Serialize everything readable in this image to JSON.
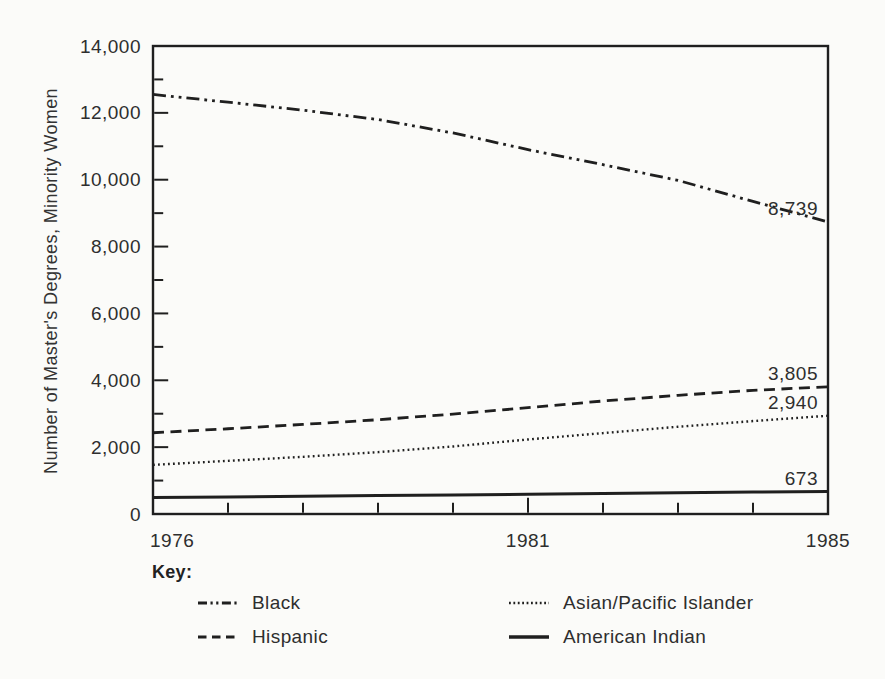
{
  "page": {
    "background": "#fbfbf9",
    "ink_color": "#1f1f1f",
    "text_color": "#2e2e2e"
  },
  "chart_data": {
    "type": "line",
    "title": "",
    "xlabel": "",
    "ylabel": "Number of Master's Degrees, Minority Women",
    "key_title": "Key:",
    "legend_position": "below-left",
    "grid": "off",
    "ylim": [
      0,
      14000
    ],
    "y_major_step": 2000,
    "y_minor_step": 1000,
    "y_tick_labels": [
      "0",
      "2,000",
      "4,000",
      "6,000",
      "8,000",
      "10,000",
      "12,000",
      "14,000"
    ],
    "x": [
      1976,
      1977,
      1978,
      1979,
      1980,
      1981,
      1982,
      1983,
      1984,
      1985
    ],
    "x_ticks": [
      {
        "label": "1976",
        "year": 1976
      },
      {
        "label": "1981",
        "year": 1981
      },
      {
        "label": "1985",
        "year": 1985
      }
    ],
    "series": [
      {
        "name": "Black",
        "line_style": "dash-dot-dot",
        "end_label": "8,739",
        "end_value": 8739,
        "values": [
          12550,
          12320,
          12080,
          11800,
          11400,
          10900,
          10450,
          9980,
          9350,
          8739
        ]
      },
      {
        "name": "Hispanic",
        "line_style": "dashed",
        "end_label": "3,805",
        "end_value": 3805,
        "values": [
          2430,
          2550,
          2680,
          2820,
          2990,
          3180,
          3380,
          3550,
          3700,
          3805
        ]
      },
      {
        "name": "Asian/Pacific Islander",
        "line_style": "dotted",
        "end_label": "2,940",
        "end_value": 2940,
        "values": [
          1470,
          1590,
          1710,
          1850,
          2020,
          2230,
          2420,
          2610,
          2780,
          2940
        ]
      },
      {
        "name": "American Indian",
        "line_style": "solid",
        "end_label": "673",
        "end_value": 673,
        "values": [
          490,
          510,
          530,
          550,
          570,
          590,
          615,
          635,
          655,
          673
        ]
      }
    ]
  }
}
